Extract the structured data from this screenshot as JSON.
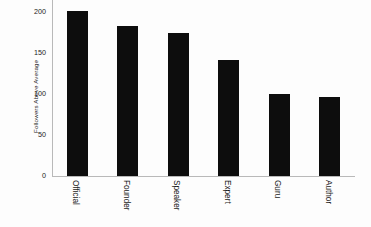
{
  "chart_data": {
    "type": "bar",
    "title": "",
    "subtitle": "",
    "xlabel": "",
    "ylabel": "Followers Above Average",
    "categories": [
      "Official",
      "Founder",
      "Speaker",
      "Expert",
      "Guru",
      "Author"
    ],
    "values": [
      202,
      183,
      175,
      142,
      100,
      96
    ],
    "series": [
      {
        "name": "Followers Above Average",
        "values": [
          202,
          183,
          175,
          142,
          100,
          96
        ]
      }
    ],
    "ylim": [
      0,
      215
    ],
    "xlim": [
      0,
      6
    ],
    "yticks": [
      0,
      50,
      100,
      150,
      200
    ],
    "ytick_labels": [
      "0",
      "50",
      "100",
      "150",
      "200"
    ],
    "grid": false,
    "legend": false,
    "legend_position": "none",
    "bar_color": "#0d0d0d",
    "axis_color": "#b9b9b9",
    "background_color": "#fdfdfd",
    "xtick_label_rotation": -90,
    "ylabel_rotation": -90,
    "annotations": []
  }
}
